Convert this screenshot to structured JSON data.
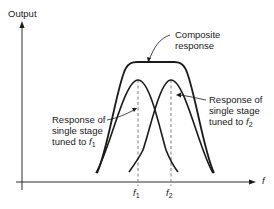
{
  "diagram": {
    "type": "frequency-response",
    "y_axis_label": "Output",
    "x_axis_label": "f",
    "ticks": [
      {
        "symbol": "f",
        "subscript": "1"
      },
      {
        "symbol": "f",
        "subscript": "2"
      }
    ],
    "annotations": {
      "composite": [
        "Composite",
        "response"
      ],
      "stage1": [
        "Response of",
        "single stage",
        "tuned to "
      ],
      "stage1_symbol": "f",
      "stage1_sub": "1",
      "stage2": [
        "Response of",
        "single stage",
        "tuned to "
      ],
      "stage2_symbol": "f",
      "stage2_sub": "2"
    },
    "curves": [
      "Composite response",
      "Single stage tuned to f1",
      "Single stage tuned to f2"
    ],
    "colors": {
      "line": "#1a1a1a",
      "dashed": "#888888"
    }
  }
}
